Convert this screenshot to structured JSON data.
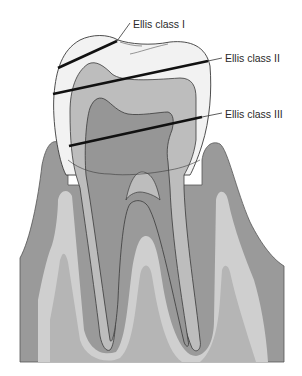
{
  "diagram": {
    "labels": [
      {
        "id": "class1",
        "text": "Ellis class I"
      },
      {
        "id": "class2",
        "text": "Ellis class II"
      },
      {
        "id": "class3",
        "text": "Ellis class III"
      }
    ],
    "colors": {
      "background": "#ffffff",
      "enamel": "#f2f2f2",
      "dentin": "#bdbdbd",
      "pulp": "#969696",
      "gum": "#9a9a9a",
      "bone_light": "#cfcfcf",
      "bone_mid": "#b5b5b5",
      "fracture_line": "#111111",
      "outline": "#3a3a3a"
    }
  }
}
